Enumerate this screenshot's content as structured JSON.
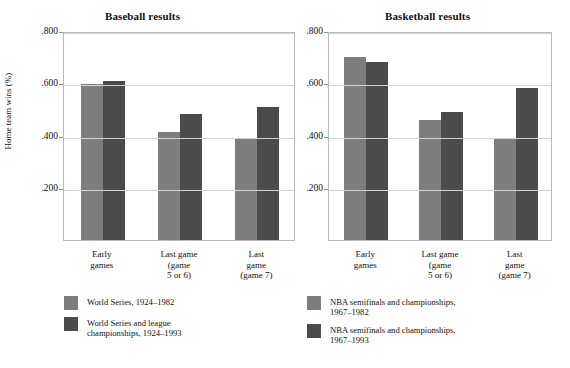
{
  "figure": {
    "y_axis_title": "Home team wins (%)"
  },
  "chart_data": [
    {
      "type": "bar",
      "title": "Baseball results",
      "xlabel": "",
      "ylabel": "Home team wins (%)",
      "ylim": [
        0,
        0.8
      ],
      "yticks": [
        0.2,
        0.4,
        0.6,
        0.8
      ],
      "ytick_labels": [
        ".200",
        ".400",
        ".600",
        ".800"
      ],
      "grid": true,
      "legend_position": "below",
      "categories": [
        "Early\ngames",
        "Last game\n(game\n5 or 6)",
        "Last\ngame\n(game 7)"
      ],
      "series": [
        {
          "name": "World Series, 1924–1982",
          "color": "#7d7d7d",
          "values": [
            0.597,
            0.412,
            0.391
          ]
        },
        {
          "name": "World Series and league\nchampionships, 1924–1993",
          "color": "#4b4b4b",
          "values": [
            0.607,
            0.484,
            0.511
          ]
        }
      ]
    },
    {
      "type": "bar",
      "title": "Basketball results",
      "xlabel": "",
      "ylabel": "Home team wins (%)",
      "ylim": [
        0,
        0.8
      ],
      "yticks": [
        0.2,
        0.4,
        0.6,
        0.8
      ],
      "ytick_labels": [
        ".200",
        ".400",
        ".600",
        ".800"
      ],
      "grid": true,
      "legend_position": "below",
      "categories": [
        "Early\ngames",
        "Last game\n(game\n5 or 6)",
        "Last\ngame\n(game 7)"
      ],
      "series": [
        {
          "name": "NBA semifinals and championships,\n1967–1982",
          "color": "#7d7d7d",
          "values": [
            0.7,
            0.458,
            0.39
          ]
        },
        {
          "name": "NBA semifinals and championships,\n1967–1993",
          "color": "#4b4b4b",
          "values": [
            0.683,
            0.49,
            0.58
          ]
        }
      ]
    }
  ]
}
